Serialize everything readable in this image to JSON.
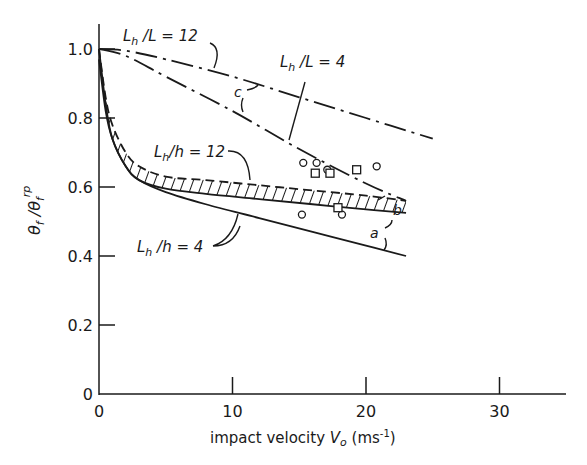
{
  "chart_data": {
    "type": "line",
    "title": "",
    "xlabel": "impact velocity V0 (ms-1)",
    "xlabel_parts": {
      "text": "impact velocity ",
      "var": "V",
      "sub": "o",
      "unit": " (ms",
      "exp": "-1",
      "close": ")"
    },
    "ylabel": "θf / θf^rp",
    "ylabel_parts": {
      "num": "θ",
      "num_sub": "f",
      "sep": " /",
      "den": "θ",
      "den_sub": "f",
      "den_sup": "rp"
    },
    "xlim": [
      0,
      35
    ],
    "ylim": [
      0,
      1.05
    ],
    "x_ticks": [
      0,
      10,
      20,
      30
    ],
    "x_tick_labels": [
      "0",
      "10",
      "20",
      "30"
    ],
    "y_ticks": [
      0,
      0.2,
      0.4,
      0.6,
      0.8,
      1.0
    ],
    "y_tick_labels": [
      "0",
      "0.2",
      "0.4",
      "0.6",
      "0.8",
      "1.0"
    ],
    "grid": false,
    "legend": "none (inline annotations)",
    "series": [
      {
        "name": "Lh/L = 12 (curve c, upper)",
        "style": "dash-dot",
        "x": [
          0,
          2,
          5,
          10,
          15,
          20,
          25
        ],
        "y": [
          1.0,
          0.995,
          0.97,
          0.92,
          0.86,
          0.8,
          0.74
        ]
      },
      {
        "name": "Lh/L = 4 (curve c, lower)",
        "style": "dash-dot",
        "x": [
          0,
          2,
          5,
          10,
          15,
          20,
          23
        ],
        "y": [
          1.0,
          0.98,
          0.92,
          0.82,
          0.71,
          0.61,
          0.56
        ]
      },
      {
        "name": "Lh/h = 12 (band upper, dashed)",
        "style": "dashed",
        "x": [
          0,
          0.5,
          1,
          2,
          3,
          5,
          8,
          12,
          16,
          20,
          23
        ],
        "y": [
          1.0,
          0.86,
          0.78,
          0.7,
          0.66,
          0.63,
          0.62,
          0.605,
          0.59,
          0.575,
          0.56
        ]
      },
      {
        "name": "Lh/h = 4 (band lower, curve b)",
        "style": "solid",
        "x": [
          0,
          0.5,
          1,
          2,
          3,
          5,
          8,
          12,
          16,
          20,
          23
        ],
        "y": [
          0.97,
          0.82,
          0.74,
          0.66,
          0.62,
          0.595,
          0.58,
          0.565,
          0.55,
          0.535,
          0.525
        ]
      },
      {
        "name": "curve a (lowest solid)",
        "style": "solid",
        "x": [
          0,
          0.5,
          1,
          2,
          3,
          5,
          8,
          12,
          16,
          20,
          23
        ],
        "y": [
          1.0,
          0.84,
          0.74,
          0.66,
          0.62,
          0.585,
          0.55,
          0.51,
          0.47,
          0.43,
          0.4
        ]
      }
    ],
    "scatter": {
      "circles": [
        [
          15.3,
          0.67
        ],
        [
          16.3,
          0.67
        ],
        [
          17.1,
          0.65
        ],
        [
          20.8,
          0.66
        ],
        [
          15.2,
          0.52
        ],
        [
          18.2,
          0.52
        ]
      ],
      "squares": [
        [
          16.2,
          0.64
        ],
        [
          17.3,
          0.64
        ],
        [
          19.3,
          0.65
        ],
        [
          17.9,
          0.54
        ]
      ]
    },
    "annotations": [
      "Lh/L = 12",
      "Lh/L = 4",
      "Lh/h = 12",
      "Lh/h = 4",
      "a",
      "b",
      "c"
    ]
  },
  "labels": {
    "lhL12": {
      "L": "L",
      "sub": "h",
      "rest": " /L  = 12"
    },
    "lhL4": {
      "L": "L",
      "sub": "h",
      "rest": " /L  = 4"
    },
    "lhh12": {
      "L": "L",
      "sub": "h",
      "rest": "/h = 12"
    },
    "lhh4": {
      "L": "L",
      "sub": "h",
      "rest": " /h = 4"
    },
    "a": "a",
    "b": "b",
    "c": "c"
  }
}
